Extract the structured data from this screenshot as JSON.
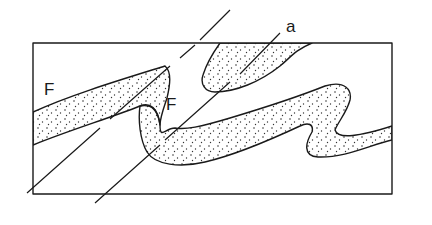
{
  "figure": {
    "type": "geological cross-section of folded layer",
    "labels": {
      "fold_left": "F",
      "fold_center": "F",
      "axial_trace": "a"
    },
    "colors": {
      "line": "#1a1a1a",
      "background": "#ffffff",
      "stipple": "#333333"
    },
    "elements": [
      "outer-frame rectangle",
      "stippled folded layer",
      "two dashed axial-plane traces",
      "label F (left antiform)",
      "label F (central synform/antiform)",
      "label a (axial trace)"
    ]
  }
}
